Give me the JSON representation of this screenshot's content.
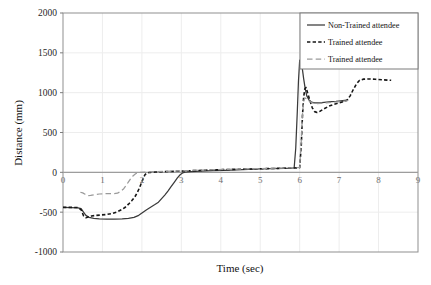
{
  "chart_data": {
    "type": "line",
    "title": "",
    "xlabel": "Time (sec)",
    "ylabel": "Distance (mm)",
    "xlim": [
      0,
      9
    ],
    "ylim": [
      -1000,
      2000
    ],
    "xticks": [
      0,
      1,
      2,
      3,
      4,
      5,
      6,
      7,
      8,
      9
    ],
    "xtick_labels": [
      "0",
      "1",
      "2",
      "3",
      "4",
      "5",
      "6",
      "7",
      "8",
      "9"
    ],
    "yticks": [
      -1000,
      -500,
      0,
      500,
      1000,
      1500,
      2000
    ],
    "ytick_labels": [
      "-1000",
      "-500",
      "0",
      "500",
      "1000",
      "1500",
      "2000"
    ],
    "grid": "horizontal-and-vertical-light",
    "legend_position": "top-right",
    "series": [
      {
        "name": "Non-Trained attendee",
        "style": "solid",
        "color": "#3a3a3a",
        "points": [
          [
            0.0,
            -440
          ],
          [
            0.2,
            -442
          ],
          [
            0.38,
            -445
          ],
          [
            0.46,
            -455
          ],
          [
            0.52,
            -500
          ],
          [
            0.58,
            -540
          ],
          [
            0.66,
            -565
          ],
          [
            0.78,
            -578
          ],
          [
            0.92,
            -585
          ],
          [
            1.1,
            -588
          ],
          [
            1.3,
            -588
          ],
          [
            1.5,
            -585
          ],
          [
            1.66,
            -578
          ],
          [
            1.8,
            -565
          ],
          [
            1.92,
            -540
          ],
          [
            2.02,
            -505
          ],
          [
            2.12,
            -470
          ],
          [
            2.22,
            -438
          ],
          [
            2.32,
            -408
          ],
          [
            2.42,
            -375
          ],
          [
            2.5,
            -330
          ],
          [
            2.58,
            -285
          ],
          [
            2.66,
            -235
          ],
          [
            2.74,
            -180
          ],
          [
            2.82,
            -125
          ],
          [
            2.9,
            -70
          ],
          [
            2.97,
            -30
          ],
          [
            3.03,
            -8
          ],
          [
            3.1,
            2
          ],
          [
            3.25,
            8
          ],
          [
            3.5,
            14
          ],
          [
            3.8,
            20
          ],
          [
            4.1,
            26
          ],
          [
            4.4,
            32
          ],
          [
            4.7,
            38
          ],
          [
            5.0,
            42
          ],
          [
            5.3,
            46
          ],
          [
            5.6,
            50
          ],
          [
            5.8,
            52
          ],
          [
            5.86,
            55
          ],
          [
            5.9,
            300
          ],
          [
            5.94,
            760
          ],
          [
            5.97,
            1150
          ],
          [
            6.0,
            1405
          ],
          [
            6.03,
            1420
          ],
          [
            6.06,
            1330
          ],
          [
            6.1,
            1180
          ],
          [
            6.14,
            1050
          ],
          [
            6.18,
            960
          ],
          [
            6.24,
            905
          ],
          [
            6.3,
            880
          ],
          [
            6.38,
            872
          ],
          [
            6.46,
            872
          ],
          [
            6.56,
            876
          ],
          [
            6.68,
            882
          ],
          [
            6.8,
            888
          ],
          [
            6.92,
            892
          ],
          [
            7.04,
            898
          ],
          [
            7.14,
            902
          ],
          [
            7.22,
            905
          ]
        ]
      },
      {
        "name": "Trained attendee",
        "style": "dashed-short",
        "color": "#161616",
        "points": [
          [
            0.0,
            -440
          ],
          [
            0.2,
            -440
          ],
          [
            0.38,
            -442
          ],
          [
            0.46,
            -470
          ],
          [
            0.52,
            -545
          ],
          [
            0.58,
            -570
          ],
          [
            0.64,
            -560
          ],
          [
            0.72,
            -548
          ],
          [
            0.84,
            -540
          ],
          [
            0.98,
            -535
          ],
          [
            1.12,
            -528
          ],
          [
            1.26,
            -515
          ],
          [
            1.38,
            -495
          ],
          [
            1.48,
            -470
          ],
          [
            1.58,
            -438
          ],
          [
            1.66,
            -400
          ],
          [
            1.74,
            -358
          ],
          [
            1.82,
            -310
          ],
          [
            1.88,
            -255
          ],
          [
            1.94,
            -195
          ],
          [
            1.99,
            -130
          ],
          [
            2.04,
            -70
          ],
          [
            2.08,
            -28
          ],
          [
            2.14,
            -8
          ],
          [
            2.22,
            0
          ],
          [
            2.35,
            4
          ],
          [
            2.55,
            8
          ],
          [
            2.8,
            12
          ],
          [
            3.05,
            16
          ],
          [
            3.35,
            22
          ],
          [
            3.7,
            28
          ],
          [
            4.05,
            34
          ],
          [
            4.4,
            38
          ],
          [
            4.75,
            42
          ],
          [
            5.1,
            46
          ],
          [
            5.45,
            50
          ],
          [
            5.75,
            54
          ],
          [
            5.95,
            56
          ],
          [
            6.0,
            58
          ],
          [
            6.04,
            330
          ],
          [
            6.07,
            700
          ],
          [
            6.1,
            940
          ],
          [
            6.13,
            1045
          ],
          [
            6.16,
            1065
          ],
          [
            6.2,
            1000
          ],
          [
            6.26,
            900
          ],
          [
            6.32,
            810
          ],
          [
            6.38,
            762
          ],
          [
            6.44,
            752
          ],
          [
            6.52,
            768
          ],
          [
            6.62,
            798
          ],
          [
            6.74,
            830
          ],
          [
            6.86,
            852
          ],
          [
            7.0,
            872
          ],
          [
            7.12,
            890
          ],
          [
            7.2,
            905
          ],
          [
            7.28,
            960
          ],
          [
            7.36,
            1040
          ],
          [
            7.44,
            1110
          ],
          [
            7.52,
            1155
          ],
          [
            7.62,
            1170
          ],
          [
            7.76,
            1172
          ],
          [
            7.92,
            1168
          ],
          [
            8.08,
            1162
          ],
          [
            8.22,
            1158
          ],
          [
            8.32,
            1155
          ]
        ]
      },
      {
        "name": "Trained attendee",
        "style": "dashed-long",
        "color": "#9a9a9a",
        "points": [
          [
            0.44,
            -250
          ],
          [
            0.5,
            -258
          ],
          [
            0.56,
            -275
          ],
          [
            0.62,
            -292
          ],
          [
            0.7,
            -290
          ],
          [
            0.8,
            -280
          ],
          [
            0.92,
            -272
          ],
          [
            1.04,
            -268
          ],
          [
            1.16,
            -268
          ],
          [
            1.28,
            -268
          ],
          [
            1.38,
            -262
          ],
          [
            1.46,
            -240
          ],
          [
            1.54,
            -205
          ],
          [
            1.6,
            -165
          ],
          [
            1.66,
            -120
          ],
          [
            1.72,
            -78
          ],
          [
            1.78,
            -42
          ],
          [
            1.84,
            -18
          ],
          [
            1.9,
            -5
          ],
          [
            1.98,
            0
          ],
          [
            2.1,
            4
          ],
          [
            2.3,
            8
          ],
          [
            2.55,
            12
          ],
          [
            2.85,
            16
          ],
          [
            3.15,
            22
          ],
          [
            3.5,
            28
          ],
          [
            3.85,
            33
          ],
          [
            4.2,
            38
          ],
          [
            4.55,
            42
          ],
          [
            4.9,
            46
          ],
          [
            5.25,
            50
          ],
          [
            5.6,
            54
          ],
          [
            5.9,
            57
          ],
          [
            6.0,
            60
          ],
          [
            6.04,
            380
          ],
          [
            6.07,
            720
          ],
          [
            6.1,
            890
          ],
          [
            6.13,
            935
          ],
          [
            6.18,
            920
          ],
          [
            6.24,
            895
          ],
          [
            6.32,
            872
          ],
          [
            6.42,
            862
          ],
          [
            6.54,
            866
          ],
          [
            6.68,
            872
          ],
          [
            6.82,
            878
          ],
          [
            6.96,
            884
          ],
          [
            7.08,
            890
          ],
          [
            7.18,
            898
          ],
          [
            7.24,
            902
          ]
        ]
      }
    ]
  },
  "legend": {
    "entries": [
      {
        "label": "Non-Trained attendee",
        "style": "solid"
      },
      {
        "label": "Trained attendee",
        "style": "dashed-short"
      },
      {
        "label": "Trained attendee",
        "style": "dashed-long"
      }
    ]
  }
}
